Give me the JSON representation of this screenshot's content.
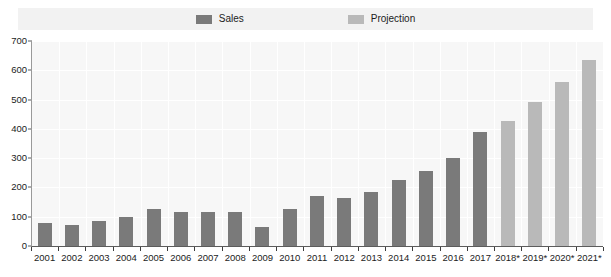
{
  "legend": {
    "entries": [
      {
        "label": "Sales",
        "color": "#7a7a7a"
      },
      {
        "label": "Projection",
        "color": "#b9b9b9"
      }
    ]
  },
  "axes": {
    "y_ticks": [
      "700",
      "600",
      "500",
      "400",
      "300",
      "200",
      "100",
      "0"
    ]
  },
  "chart_data": {
    "type": "bar",
    "title": "",
    "subtitle": "",
    "xlabel": "",
    "ylabel": "",
    "ylim": [
      0,
      700
    ],
    "ytick_step": 100,
    "grid": true,
    "legend_position": "top-center",
    "categories": [
      "2001",
      "2002",
      "2003",
      "2004",
      "2005",
      "2006",
      "2007",
      "2008",
      "2009",
      "2010",
      "2011",
      "2012",
      "2013",
      "2014",
      "2015",
      "2016",
      "2017",
      "2018*",
      "2019*",
      "2020*",
      "2021*"
    ],
    "series": [
      {
        "name": "Sales",
        "color": "#7a7a7a",
        "values": [
          80,
          72,
          87,
          100,
          125,
          115,
          115,
          115,
          66,
          128,
          172,
          165,
          186,
          226,
          257,
          302,
          390,
          null,
          null,
          null,
          null
        ]
      },
      {
        "name": "Projection",
        "color": "#b9b9b9",
        "values": [
          null,
          null,
          null,
          null,
          null,
          null,
          null,
          null,
          null,
          null,
          null,
          null,
          null,
          null,
          null,
          null,
          null,
          428,
          492,
          560,
          635
        ]
      }
    ]
  }
}
